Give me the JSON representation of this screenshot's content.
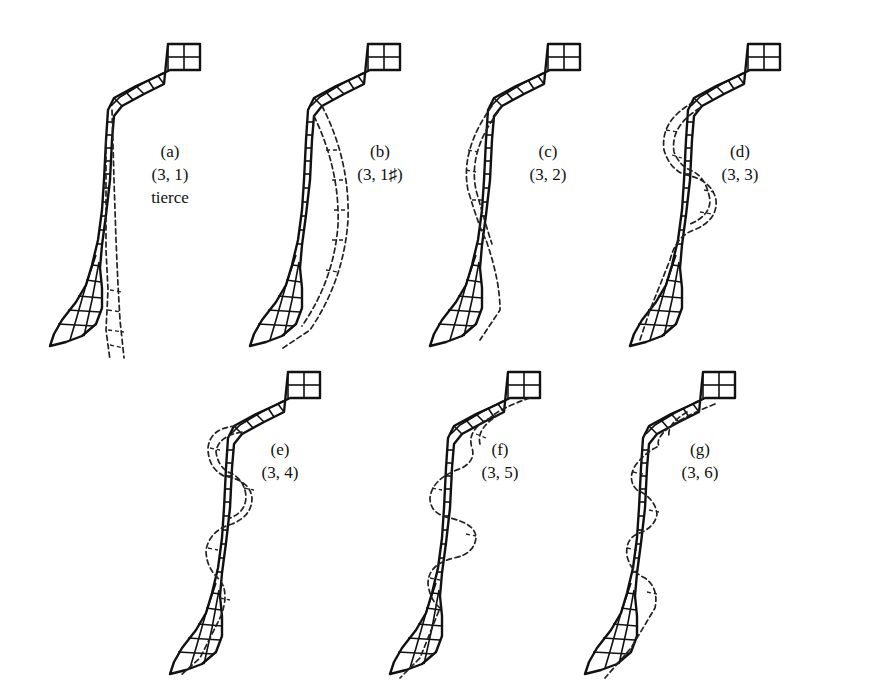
{
  "figure": {
    "panels": [
      {
        "id": "a",
        "letter": "(a)",
        "mode": "(3, 1)",
        "note": "tierce"
      },
      {
        "id": "b",
        "letter": "(b)",
        "mode": "(3, 1♯)",
        "note": ""
      },
      {
        "id": "c",
        "letter": "(c)",
        "mode": "(3, 2)",
        "note": ""
      },
      {
        "id": "d",
        "letter": "(d)",
        "mode": "(3, 3)",
        "note": ""
      },
      {
        "id": "e",
        "letter": "(e)",
        "mode": "(3, 4)",
        "note": ""
      },
      {
        "id": "f",
        "letter": "(f)",
        "mode": "(3, 5)",
        "note": ""
      },
      {
        "id": "g",
        "letter": "(g)",
        "mode": "(3, 6)",
        "note": ""
      }
    ],
    "legend": {
      "solid_line": "undeformed mesh",
      "dashed_line": "mode shape"
    },
    "colors": {
      "ink": "#111111",
      "background": "#ffffff"
    }
  }
}
